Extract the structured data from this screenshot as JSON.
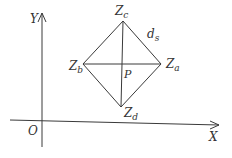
{
  "diagram": {
    "axes": {
      "y_label": "Y",
      "x_label": "X",
      "origin_label": "O"
    },
    "points": {
      "zc": {
        "base": "Z",
        "sub": "c"
      },
      "za": {
        "base": "Z",
        "sub": "a"
      },
      "zb": {
        "base": "Z",
        "sub": "b"
      },
      "zd": {
        "base": "Z",
        "sub": "d"
      },
      "p": "P"
    },
    "edge_label": {
      "base": "d",
      "sub": "s"
    },
    "colors": {
      "line": "#3a3a3a",
      "text": "#333333",
      "background": "#ffffff"
    }
  }
}
